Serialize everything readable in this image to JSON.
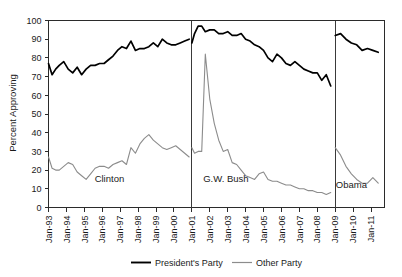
{
  "chart_data": {
    "type": "line",
    "title": "",
    "xlabel": "",
    "ylabel": "Percent Approving",
    "ylim": [
      0,
      100
    ],
    "ytick_step": 10,
    "yticks": [
      0,
      10,
      20,
      30,
      40,
      50,
      60,
      70,
      80,
      90,
      100
    ],
    "xlim": [
      "Jan-93",
      "Jan-11"
    ],
    "xticks": [
      "Jan-93",
      "Jan-94",
      "Jan-95",
      "Jan-96",
      "Jan-97",
      "Jan-98",
      "Jan-99",
      "Jan-00",
      "Jan-01",
      "Jan-02",
      "Jan-03",
      "Jan-04",
      "Jan-05",
      "Jan-06",
      "Jan-07",
      "Jan-08",
      "Jan-09",
      "Jan-10",
      "Jan-11"
    ],
    "grid": false,
    "legend_position": "bottom-center",
    "legend": [
      "President's Party",
      "Other Party"
    ],
    "colors": {
      "presidents_party": "#000000",
      "other_party": "#8c8c8c",
      "axis": "#2b2b2b",
      "background": "#ffffff"
    },
    "era_dividers": [
      {
        "label": "Clinton",
        "at": "Jan-93"
      },
      {
        "label": "G.W. Bush",
        "at": "Jan-01"
      },
      {
        "label": "Obama",
        "at": "Jan-09"
      }
    ],
    "era_annotations": [
      {
        "text": "Clinton",
        "x": "Jun-96",
        "y": 14
      },
      {
        "text": "G.W. Bush",
        "x": "Nov-02",
        "y": 14
      },
      {
        "text": "Obama",
        "x": "Jul-09",
        "y": 11
      }
    ],
    "series": [
      {
        "name": "President's Party",
        "color": "#000000",
        "segments": [
          {
            "era": "Clinton",
            "x": [
              "1993.0",
              "1993.2",
              "1993.4",
              "1993.6",
              "1993.85",
              "1994.1",
              "1994.35",
              "1994.6",
              "1994.85",
              "1995.1",
              "1995.35",
              "1995.6",
              "1995.85",
              "1996.1",
              "1996.35",
              "1996.6",
              "1996.85",
              "1997.1",
              "1997.35",
              "1997.6",
              "1997.85",
              "1998.1",
              "1998.35",
              "1998.6",
              "1998.85",
              "1999.1",
              "1999.35",
              "1999.6",
              "1999.85",
              "2000.1",
              "2000.35",
              "2000.6",
              "2000.85"
            ],
            "y": [
              77,
              71,
              74,
              76,
              78,
              74,
              72,
              75,
              71,
              74,
              76,
              76,
              77,
              77,
              79,
              81,
              84,
              86,
              85,
              89,
              84,
              85,
              85,
              86,
              88,
              86,
              90,
              88,
              87,
              87,
              88,
              89,
              90
            ]
          },
          {
            "era": "G.W. Bush",
            "x": [
              "2001.0",
              "2001.15",
              "2001.35",
              "2001.55",
              "2001.75",
              "2002.0",
              "2002.25",
              "2002.5",
              "2002.75",
              "2003.0",
              "2003.25",
              "2003.5",
              "2003.75",
              "2004.0",
              "2004.25",
              "2004.5",
              "2004.75",
              "2005.0",
              "2005.25",
              "2005.5",
              "2005.75",
              "2006.0",
              "2006.25",
              "2006.5",
              "2006.75",
              "2007.0",
              "2007.25",
              "2007.5",
              "2007.75",
              "2008.0",
              "2008.25",
              "2008.5",
              "2008.75"
            ],
            "y": [
              88,
              93,
              97,
              97,
              94,
              95,
              95,
              93,
              93,
              94,
              92,
              92,
              93,
              90,
              89,
              87,
              86,
              84,
              80,
              78,
              82,
              80,
              77,
              76,
              78,
              76,
              74,
              73,
              72,
              72,
              68,
              71,
              65
            ]
          },
          {
            "era": "Obama",
            "x": [
              "2009.0",
              "2009.3",
              "2009.6",
              "2009.9",
              "2010.2",
              "2010.5",
              "2010.8",
              "2011.1",
              "2011.4"
            ],
            "y": [
              92,
              93,
              90,
              88,
              87,
              84,
              85,
              84,
              83
            ]
          }
        ]
      },
      {
        "name": "Other Party",
        "color": "#8c8c8c",
        "segments": [
          {
            "era": "Clinton",
            "x": [
              "1993.0",
              "1993.2",
              "1993.4",
              "1993.6",
              "1993.85",
              "1994.1",
              "1994.35",
              "1994.6",
              "1994.85",
              "1995.1",
              "1995.35",
              "1995.6",
              "1995.85",
              "1996.1",
              "1996.35",
              "1996.6",
              "1996.85",
              "1997.1",
              "1997.35",
              "1997.6",
              "1997.85",
              "1998.1",
              "1998.35",
              "1998.6",
              "1998.85",
              "1999.1",
              "1999.35",
              "1999.6",
              "1999.85",
              "2000.1",
              "2000.35",
              "2000.6",
              "2000.85"
            ],
            "y": [
              27,
              21,
              20,
              20,
              22,
              24,
              23,
              19,
              17,
              15,
              18,
              21,
              22,
              22,
              21,
              23,
              24,
              25,
              23,
              32,
              29,
              34,
              37,
              39,
              36,
              34,
              32,
              31,
              32,
              33,
              31,
              29,
              27
            ]
          },
          {
            "era": "G.W. Bush",
            "x": [
              "2001.0",
              "2001.15",
              "2001.35",
              "2001.55",
              "2001.75",
              "2002.0",
              "2002.25",
              "2002.5",
              "2002.75",
              "2003.0",
              "2003.25",
              "2003.5",
              "2003.75",
              "2004.0",
              "2004.25",
              "2004.5",
              "2004.75",
              "2005.0",
              "2005.25",
              "2005.5",
              "2005.75",
              "2006.0",
              "2006.25",
              "2006.5",
              "2006.75",
              "2007.0",
              "2007.25",
              "2007.5",
              "2007.75",
              "2008.0",
              "2008.25",
              "2008.5",
              "2008.75"
            ],
            "y": [
              32,
              29,
              30,
              30,
              82,
              58,
              45,
              36,
              30,
              31,
              24,
              23,
              20,
              17,
              16,
              15,
              18,
              19,
              15,
              14,
              14,
              13,
              12,
              12,
              11,
              10,
              10,
              9,
              9,
              8,
              8,
              7,
              8
            ]
          },
          {
            "era": "Obama",
            "x": [
              "2009.0",
              "2009.3",
              "2009.6",
              "2009.9",
              "2010.2",
              "2010.5",
              "2010.8",
              "2011.1",
              "2011.4"
            ],
            "y": [
              32,
              28,
              22,
              18,
              15,
              13,
              13,
              16,
              13
            ]
          }
        ]
      }
    ]
  },
  "axis": {
    "y_title": "Percent Approving",
    "y_ticks": [
      "0",
      "10",
      "20",
      "30",
      "40",
      "50",
      "60",
      "70",
      "80",
      "90",
      "100"
    ],
    "x_ticks": [
      "Jan-93",
      "Jan-94",
      "Jan-95",
      "Jan-96",
      "Jan-97",
      "Jan-98",
      "Jan-99",
      "Jan-00",
      "Jan-01",
      "Jan-02",
      "Jan-03",
      "Jan-04",
      "Jan-05",
      "Jan-06",
      "Jan-07",
      "Jan-08",
      "Jan-09",
      "Jan-10",
      "Jan-11"
    ]
  },
  "annotations": {
    "clinton": "Clinton",
    "bush": "G.W. Bush",
    "obama": "Obama"
  },
  "legend": {
    "presidents_party": "President's Party",
    "other_party": "Other Party"
  }
}
